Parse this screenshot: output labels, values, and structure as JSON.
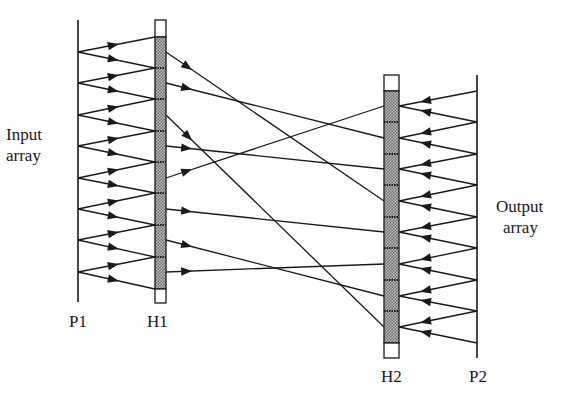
{
  "diagram": {
    "type": "optical-interconnect / holographic routing diagram",
    "labels": {
      "input_line1": "Input",
      "input_line2": "array",
      "output_line1": "Output",
      "output_line2": "array",
      "p1": "P1",
      "h1": "H1",
      "h2": "H2",
      "p2": "P2"
    },
    "colors": {
      "line": "#1a1a1a",
      "shade": "#8a8a8a",
      "box_fill": "#ffffff"
    },
    "planes": {
      "P1": {
        "x": 78,
        "y_top": 20,
        "y_bottom": 302,
        "nodes_y": [
          52,
          83,
          115,
          146,
          178,
          209,
          240,
          272
        ]
      },
      "H1": {
        "x_left": 155,
        "x_right": 166,
        "cap_top": [
          20,
          37
        ],
        "cap_bottom": [
          289,
          303
        ],
        "junctions_y": [
          37,
          68,
          99,
          131,
          162,
          193,
          225,
          257,
          289
        ],
        "outputs_y": [
          52,
          83,
          115,
          146,
          178,
          209,
          240,
          272
        ]
      },
      "H2": {
        "x_left": 384,
        "x_right": 399,
        "cap_top": [
          75,
          91
        ],
        "cap_bottom": [
          343,
          358
        ],
        "nodes_y": [
          106,
          138,
          169,
          201,
          232,
          264,
          296,
          327
        ]
      },
      "P2": {
        "x": 477,
        "y_top": 75,
        "y_bottom": 358,
        "junctions_y": [
          91,
          122,
          154,
          185,
          217,
          248,
          280,
          311,
          343
        ]
      }
    },
    "interconnect": [
      {
        "from_h1": 0,
        "to_h2": 3
      },
      {
        "from_h1": 1,
        "to_h2": 1
      },
      {
        "from_h1": 2,
        "to_h2": 7
      },
      {
        "from_h1": 3,
        "to_h2": 2
      },
      {
        "from_h1": 4,
        "to_h2": 0
      },
      {
        "from_h1": 5,
        "to_h2": 4
      },
      {
        "from_h1": 6,
        "to_h2": 6
      },
      {
        "from_h1": 7,
        "to_h2": 5
      }
    ]
  }
}
